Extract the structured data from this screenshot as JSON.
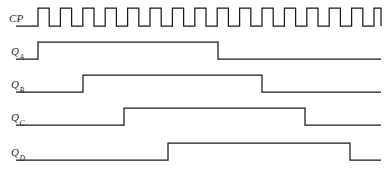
{
  "diagram": {
    "width": 387,
    "height": 178,
    "line_color": "#1a1a1a",
    "background_color": "#ffffff",
    "text_color": "#2b2b2b"
  },
  "rows": [
    {
      "id": "cp",
      "label_main": "CP",
      "label_sub": "",
      "baseline_y": 26,
      "high_y": 8,
      "signal_type": "clock",
      "start_x": 38,
      "end_x": 381,
      "pulse_count": 16,
      "period": 22.4,
      "duty": 0.5,
      "transitions": []
    },
    {
      "id": "qa",
      "label_main": "Q",
      "label_sub": "A",
      "baseline_y": 59,
      "high_y": 42,
      "signal_type": "level",
      "start_x": 16,
      "end_x": 381,
      "transitions": [
        38,
        218
      ]
    },
    {
      "id": "qb",
      "label_main": "Q",
      "label_sub": "B",
      "baseline_y": 92,
      "high_y": 75,
      "signal_type": "level",
      "start_x": 16,
      "end_x": 381,
      "transitions": [
        83,
        262
      ]
    },
    {
      "id": "qc",
      "label_main": "Q",
      "label_sub": "C",
      "baseline_y": 125,
      "high_y": 108,
      "signal_type": "level",
      "start_x": 16,
      "end_x": 381,
      "transitions": [
        124,
        305
      ]
    },
    {
      "id": "qd",
      "label_main": "Q",
      "label_sub": "D",
      "baseline_y": 160,
      "high_y": 143,
      "signal_type": "level",
      "start_x": 16,
      "end_x": 381,
      "transitions": [
        168,
        350
      ]
    }
  ],
  "labels": [
    {
      "id": "cp",
      "x": 9,
      "y": 12,
      "main": "CP",
      "sub": ""
    },
    {
      "id": "qa",
      "x": 11,
      "y": 45,
      "main": "Q",
      "sub": "A"
    },
    {
      "id": "qb",
      "x": 11,
      "y": 78,
      "main": "Q",
      "sub": "B"
    },
    {
      "id": "qc",
      "x": 11,
      "y": 111,
      "main": "Q",
      "sub": "C"
    },
    {
      "id": "qd",
      "x": 11,
      "y": 146,
      "main": "Q",
      "sub": "D"
    }
  ],
  "chart_data": {
    "type": "line",
    "xlabel": "",
    "ylabel": "",
    "series": [
      {
        "name": "CP",
        "description": "clock, 16 pulses, 50% duty",
        "rising_edges": [
          38,
          60.4,
          82.8,
          105.2,
          127.6,
          150,
          172.4,
          194.8,
          217.2,
          239.6,
          262,
          284.4,
          306.8,
          329.2,
          351.6,
          374
        ],
        "falling_edges": [
          49.2,
          71.6,
          94,
          116.4,
          138.8,
          161.2,
          183.6,
          206,
          228.4,
          250.8,
          273.2,
          295.6,
          318,
          340.4,
          362.8,
          381
        ]
      },
      {
        "name": "QA",
        "description": "rises at 38, falls at 218",
        "rising_edges": [
          38
        ],
        "falling_edges": [
          218
        ]
      },
      {
        "name": "QB",
        "description": "rises at 83, falls at 262",
        "rising_edges": [
          83
        ],
        "falling_edges": [
          262
        ]
      },
      {
        "name": "QC",
        "description": "rises at 124, falls at 305",
        "rising_edges": [
          124
        ],
        "falling_edges": [
          305
        ]
      },
      {
        "name": "QD",
        "description": "rises at 168, falls at 350",
        "rising_edges": [
          168
        ],
        "falling_edges": [
          350
        ]
      }
    ]
  }
}
